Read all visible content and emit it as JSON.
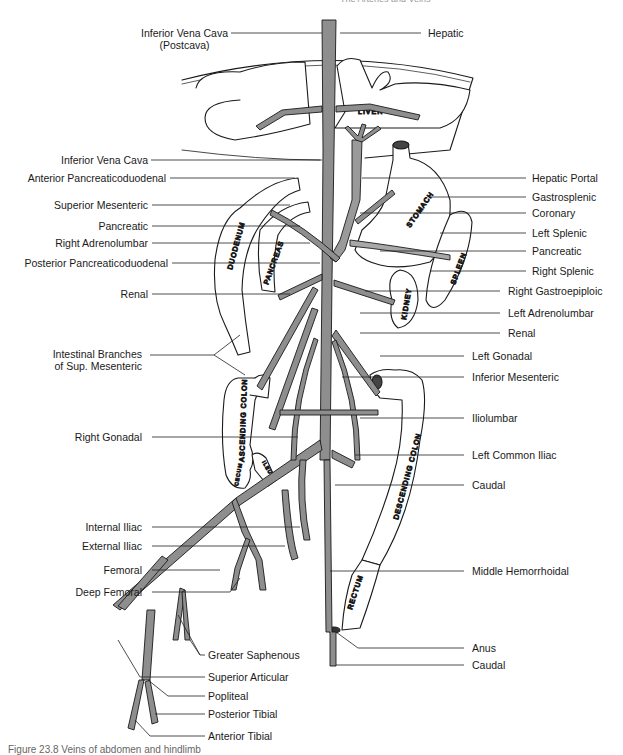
{
  "header": {
    "left": "",
    "right": "The Arteries and Veins"
  },
  "caption": "Figure 23.8  Veins of abdomen and hindlimb",
  "organs": {
    "liver": "LIVER",
    "stomach": "STOMACH",
    "spleen": "SPLEEN",
    "duodenum": "DUODENUM",
    "pancreas": "PANCREAS",
    "kidney": "KIDNEY",
    "ascending_colon": "ASCENDING COLON",
    "descending_colon": "DESCENDING COLON",
    "cecum": "CECUM",
    "ileum": "ILEUM",
    "rectum": "RECTUM"
  },
  "labels_left": [
    {
      "id": "inferior-vena-cava-postcava",
      "line1": "Inferior Vena Cava",
      "line2": "(Postcava)"
    },
    {
      "id": "inferior-vena-cava",
      "line1": "Inferior Vena Cava"
    },
    {
      "id": "anterior-pancreaticoduodenal",
      "line1": "Anterior Pancreaticoduodenal"
    },
    {
      "id": "superior-mesenteric",
      "line1": "Superior Mesenteric"
    },
    {
      "id": "pancreatic-left",
      "line1": "Pancreatic"
    },
    {
      "id": "right-adrenolumbar",
      "line1": "Right Adrenolumbar"
    },
    {
      "id": "posterior-pancreaticoduodenal",
      "line1": "Posterior Pancreaticoduodenal"
    },
    {
      "id": "renal-left",
      "line1": "Renal"
    },
    {
      "id": "intestinal-branches",
      "line1": "Intestinal Branches",
      "line2": "of Sup. Mesenteric"
    },
    {
      "id": "right-gonadal",
      "line1": "Right Gonadal"
    },
    {
      "id": "internal-iliac",
      "line1": "Internal Iliac"
    },
    {
      "id": "external-iliac",
      "line1": "External Iliac"
    },
    {
      "id": "femoral",
      "line1": "Femoral"
    },
    {
      "id": "deep-femoral",
      "line1": "Deep Femoral"
    }
  ],
  "labels_right": [
    {
      "id": "hepatic",
      "line1": "Hepatic"
    },
    {
      "id": "hepatic-portal",
      "line1": "Hepatic Portal"
    },
    {
      "id": "gastrosplenic",
      "line1": "Gastrosplenic"
    },
    {
      "id": "coronary",
      "line1": "Coronary"
    },
    {
      "id": "left-splenic",
      "line1": "Left Splenic"
    },
    {
      "id": "pancreatic-right",
      "line1": "Pancreatic"
    },
    {
      "id": "right-splenic",
      "line1": "Right Splenic"
    },
    {
      "id": "right-gastroepiploic",
      "line1": "Right Gastroepiploic"
    },
    {
      "id": "left-adrenolumbar",
      "line1": "Left Adrenolumbar"
    },
    {
      "id": "renal-right",
      "line1": "Renal"
    },
    {
      "id": "left-gonadal",
      "line1": "Left Gonadal"
    },
    {
      "id": "inferior-mesenteric",
      "line1": "Inferior Mesenteric"
    },
    {
      "id": "iliolumbar",
      "line1": "Iliolumbar"
    },
    {
      "id": "left-common-iliac",
      "line1": "Left Common Iliac"
    },
    {
      "id": "caudal-upper",
      "line1": "Caudal"
    },
    {
      "id": "middle-hemorrhoidal",
      "line1": "Middle Hemorrhoidal"
    },
    {
      "id": "anus",
      "line1": "Anus"
    },
    {
      "id": "caudal-lower",
      "line1": "Caudal"
    }
  ],
  "labels_bottom": [
    {
      "id": "greater-saphenous",
      "line1": "Greater Saphenous"
    },
    {
      "id": "superior-articular",
      "line1": "Superior Articular"
    },
    {
      "id": "popliteal",
      "line1": "Popliteal"
    },
    {
      "id": "posterior-tibial",
      "line1": "Posterior Tibial"
    },
    {
      "id": "anterior-tibial",
      "line1": "Anterior Tibial"
    }
  ],
  "colors": {
    "vein_fill": "#8e8e8e",
    "outline": "#1a1a1a",
    "leader": "#222222",
    "portal_fill": "#a8a8a8"
  }
}
